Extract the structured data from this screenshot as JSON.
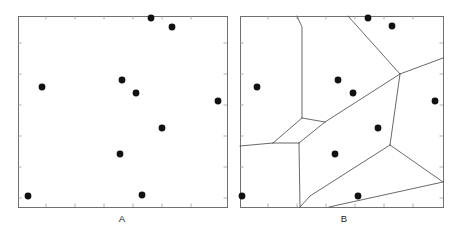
{
  "figure": {
    "width": 462,
    "height": 234,
    "background": "#ffffff"
  },
  "style": {
    "frame_color": "#707070",
    "tick_color": "#9a9a9a",
    "dot_color": "#111111",
    "edge_color": "#4d4d4d",
    "label_color": "#1a1a1a",
    "dot_radius": 3.4
  },
  "panels": [
    {
      "id": "panel-a",
      "label": "A",
      "label_x": 122,
      "label_y": 222,
      "frame": {
        "x": 18,
        "y": 16,
        "width": 209,
        "height": 191
      },
      "ticks_bottom": [
        46,
        75,
        104,
        133,
        162,
        191
      ],
      "ticks_top": [
        46,
        75,
        104,
        133,
        162,
        191
      ],
      "ticks_left": [
        43,
        74,
        105,
        136,
        167,
        198
      ],
      "ticks_right": [
        43,
        74,
        105,
        136,
        167,
        198
      ],
      "points": [
        [
          151,
          18
        ],
        [
          172,
          27
        ],
        [
          42,
          87
        ],
        [
          122,
          80
        ],
        [
          136,
          93
        ],
        [
          218,
          101
        ],
        [
          162,
          128
        ],
        [
          120,
          154
        ],
        [
          28,
          196
        ],
        [
          142,
          195
        ]
      ]
    },
    {
      "id": "panel-b",
      "label": "B",
      "label_x": 344,
      "label_y": 222,
      "frame": {
        "x": 240,
        "y": 16,
        "width": 203,
        "height": 191
      },
      "ticks_bottom": [
        268,
        297,
        326,
        355,
        384,
        413
      ],
      "ticks_top": [
        268,
        297,
        326,
        355,
        384,
        413
      ],
      "ticks_left": [
        43,
        74,
        105,
        136,
        167,
        198
      ],
      "ticks_right": [
        43,
        74,
        105,
        136,
        167,
        198
      ],
      "points": [
        [
          368,
          18
        ],
        [
          392,
          26
        ],
        [
          257,
          87
        ],
        [
          338,
          80
        ],
        [
          353,
          93
        ],
        [
          435,
          101
        ],
        [
          378,
          128
        ],
        [
          335,
          154
        ],
        [
          242,
          196
        ],
        [
          358,
          196
        ]
      ],
      "voronoi_edges": [
        [
          [
            297,
            16
          ],
          [
            302,
            27
          ],
          [
            302,
            118
          ]
        ],
        [
          [
            302,
            118
          ],
          [
            273,
            143
          ]
        ],
        [
          [
            273,
            143
          ],
          [
            240,
            146
          ]
        ],
        [
          [
            273,
            143
          ],
          [
            299,
            143
          ]
        ],
        [
          [
            299,
            143
          ],
          [
            300,
            207
          ]
        ],
        [
          [
            299,
            143
          ],
          [
            325,
            122
          ]
        ],
        [
          [
            325,
            122
          ],
          [
            302,
            118
          ]
        ],
        [
          [
            325,
            122
          ],
          [
            400,
            74
          ]
        ],
        [
          [
            400,
            74
          ],
          [
            443,
            58
          ]
        ],
        [
          [
            400,
            74
          ],
          [
            348,
            16
          ]
        ],
        [
          [
            400,
            74
          ],
          [
            390,
            145
          ]
        ],
        [
          [
            390,
            145
          ],
          [
            443,
            182
          ]
        ],
        [
          [
            390,
            145
          ],
          [
            310,
            196
          ]
        ],
        [
          [
            310,
            196
          ],
          [
            300,
            207
          ]
        ],
        [
          [
            443,
            182
          ],
          [
            329,
            207
          ]
        ]
      ]
    }
  ]
}
